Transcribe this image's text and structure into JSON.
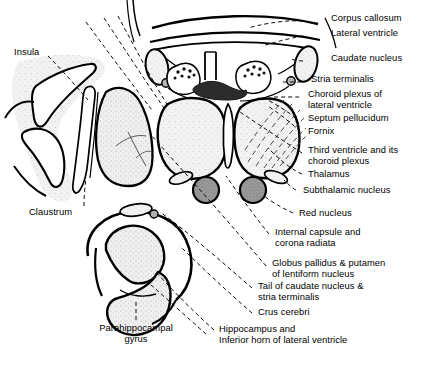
{
  "figure": {
    "kind": "anatomical-diagram",
    "background_color": "#ffffff",
    "ink_color": "#000000",
    "leader_line_style": "dashed"
  },
  "palette": {
    "outline": "#000000",
    "cortex_stipple": "#e3e3e3",
    "thalamus_fill": "#e8e8e8",
    "lentiform_fill": "#dcdcdc",
    "red_nucleus_fill": "#9a9a9a",
    "subthalamic_fill": "#d8d8d8",
    "fornix_dark": "#2b2b2b",
    "hippocampus_fill": "#e0e0e0",
    "leader_color": "#000000"
  },
  "labels": {
    "left": [
      {
        "id": "insula",
        "text": "Insula",
        "x": 14,
        "y": 51,
        "align": "left"
      },
      {
        "id": "claustrum",
        "text": "Claustrum",
        "x": 29,
        "y": 211,
        "align": "left"
      },
      {
        "id": "parahippocampal-gyrus",
        "text": "Parahippocampal\ngyrus",
        "x": 93,
        "y": 327,
        "align": "center"
      }
    ],
    "right": [
      {
        "id": "corpus-callosum",
        "text": "Corpus callosum",
        "x": 331,
        "y": 17,
        "align": "left"
      },
      {
        "id": "lateral-ventricle",
        "text": "Lateral ventricle",
        "x": 331,
        "y": 32,
        "align": "left"
      },
      {
        "id": "caudate-nucleus",
        "text": "Caudate nucleus",
        "x": 331,
        "y": 57,
        "align": "left"
      },
      {
        "id": "stria-terminalis",
        "text": "Stria terminalis",
        "x": 311,
        "y": 78,
        "align": "left"
      },
      {
        "id": "choroid-plexus-of-lateral-ventricle",
        "text": "Choroid plexus of\nlateral ventricle",
        "x": 308,
        "y": 93,
        "align": "left"
      },
      {
        "id": "septum-pellucidum",
        "text": "Septum pellucidum",
        "x": 308,
        "y": 117,
        "align": "left"
      },
      {
        "id": "fornix",
        "text": "Fornix",
        "x": 308,
        "y": 130,
        "align": "left"
      },
      {
        "id": "third-ventricle-and-choroid-plexus",
        "text": "Third ventricle and its\nchoroid plexus",
        "x": 308,
        "y": 149,
        "align": "left"
      },
      {
        "id": "thalamus",
        "text": "Thalamus",
        "x": 308,
        "y": 173,
        "align": "left"
      },
      {
        "id": "subthalamic-nucleus",
        "text": "Subthalamic nucleus",
        "x": 303,
        "y": 189,
        "align": "left"
      },
      {
        "id": "red-nucleus",
        "text": "Red nucleus",
        "x": 299,
        "y": 212,
        "align": "left"
      },
      {
        "id": "internal-capsule-and-corona-radiata",
        "text": "Internal capsule and\ncorona radiata",
        "x": 275,
        "y": 231,
        "align": "left"
      },
      {
        "id": "globus-pallidus-and-putamen",
        "text": "Globus pallidus & putamen\nof lentiform nucleus",
        "x": 272,
        "y": 262,
        "align": "left"
      },
      {
        "id": "tail-of-caudate-nucleus-and-stria-terminalis",
        "text": "Tail of caudate nucleus &\nstria terminalis",
        "x": 258,
        "y": 285,
        "align": "left"
      },
      {
        "id": "crus-cerebri",
        "text": "Crus cerebri",
        "x": 258,
        "y": 311,
        "align": "left"
      },
      {
        "id": "hippocampus-and-inferior-horn",
        "text": "Hippocampus and\nInferior horn of lateral ventricle",
        "x": 219,
        "y": 328,
        "align": "left"
      }
    ]
  }
}
